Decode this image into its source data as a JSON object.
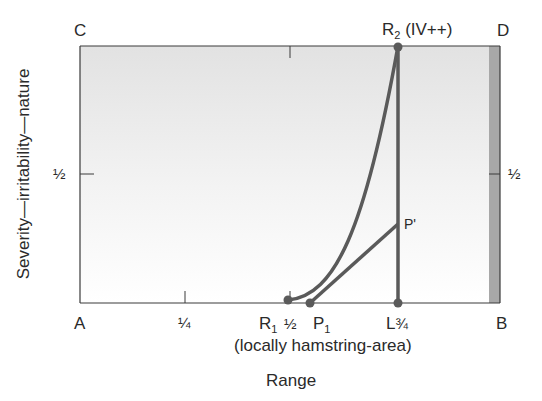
{
  "corners": {
    "top_left": "C",
    "top_right": "D",
    "bottom_left": "A",
    "bottom_right": "B"
  },
  "x_axis": {
    "title": "Range",
    "quarter_tick": "¼",
    "half_tick": "½",
    "three_quarter_tick": "¾",
    "subtitle": "(locally hamstring-area)"
  },
  "y_axis": {
    "title": "Severity—irritability—nature",
    "half_tick_left": "½",
    "half_tick_right": "½"
  },
  "points": {
    "R1": {
      "letter": "R",
      "sub": "1"
    },
    "P1": {
      "letter": "P",
      "sub": "1"
    },
    "L": {
      "letter": "L"
    },
    "P_prime": {
      "label": "P'"
    },
    "R2": {
      "letter": "R",
      "sub": "2",
      "suffix": " (IV++)"
    }
  },
  "colors": {
    "line": "#5a5a5a",
    "frame": "#3a3a3a",
    "fill_top": "#e4e4e4",
    "fill_bottom": "#ffffff",
    "strip": "#a8a8a8"
  }
}
